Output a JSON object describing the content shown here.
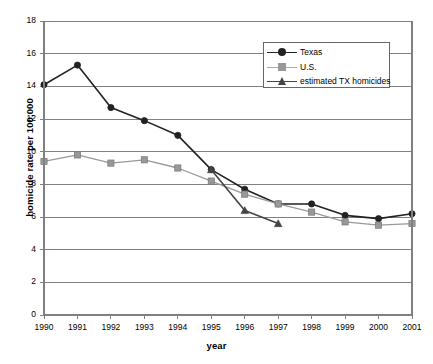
{
  "chart_data": {
    "type": "line",
    "title": "",
    "xlabel": "year",
    "ylabel": "homicide rate per 100,000",
    "x": [
      1990,
      1991,
      1992,
      1993,
      1994,
      1995,
      1996,
      1997,
      1998,
      1999,
      2000,
      2001
    ],
    "xlim": [
      1990,
      2001
    ],
    "ylim": [
      0,
      18
    ],
    "ytick_step": 2,
    "grid": true,
    "legend_position": "top-right",
    "xticklabels": [
      "1990",
      "1991",
      "1992",
      "1993",
      "1994",
      "1995",
      "1996",
      "1997",
      "1998",
      "1999",
      "2000",
      "2001"
    ],
    "yticklabels": [
      "0",
      "2",
      "4",
      "6",
      "8",
      "10",
      "12",
      "14",
      "16",
      "18"
    ],
    "series": [
      {
        "name": "Texas",
        "marker": "circle",
        "color": "#222222",
        "x": [
          1990,
          1991,
          1992,
          1993,
          1994,
          1995,
          1996,
          1997,
          1998,
          1999,
          2000,
          2001
        ],
        "values": [
          14.1,
          15.3,
          12.7,
          11.9,
          11.0,
          8.9,
          7.7,
          6.8,
          6.8,
          6.1,
          5.9,
          6.2
        ]
      },
      {
        "name": "U.S.",
        "marker": "square",
        "color": "#999999",
        "x": [
          1990,
          1991,
          1992,
          1993,
          1994,
          1995,
          1996,
          1997,
          1998,
          1999,
          2000,
          2001
        ],
        "values": [
          9.4,
          9.8,
          9.3,
          9.5,
          9.0,
          8.2,
          7.4,
          6.8,
          6.3,
          5.7,
          5.5,
          5.6
        ]
      },
      {
        "name": "estimated TX homicides",
        "marker": "triangle",
        "color": "#444444",
        "x": [
          1995,
          1996,
          1997
        ],
        "values": [
          8.9,
          6.4,
          5.6
        ]
      }
    ]
  },
  "legend": {
    "items": [
      {
        "label": "Texas",
        "marker": "circle",
        "color": "#222222"
      },
      {
        "label": "U.S.",
        "marker": "square",
        "color": "#999999"
      },
      {
        "label": "estimated TX homicides",
        "marker": "triangle",
        "color": "#444444"
      }
    ]
  }
}
